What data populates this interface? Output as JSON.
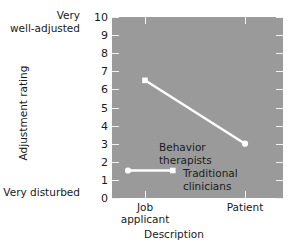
{
  "chart_data": {
    "type": "line",
    "title": "",
    "xlabel": "Description",
    "ylabel": "Adjustment rating",
    "categories": [
      "Job applicant",
      "Patient"
    ],
    "x": [
      0,
      1
    ],
    "ylim": [
      0,
      10
    ],
    "yticks": [
      0,
      1,
      2,
      3,
      4,
      5,
      6,
      7,
      8,
      9,
      10
    ],
    "ytick_labels": [
      "0",
      "1",
      "2",
      "3",
      "4",
      "5",
      "6",
      "7",
      "8",
      "9",
      "10"
    ],
    "y_axis_low_label": "Very disturbed",
    "y_axis_high_label_line1": "Very",
    "y_axis_high_label_line2": "well-adjusted",
    "grid": false,
    "legend_position": "inside-lower-left",
    "series": [
      {
        "name": "Traditional clinicians",
        "values": [
          6.5,
          3.0
        ],
        "color": "#ffffff",
        "marker": "circle-square",
        "linewidth": 2.4
      },
      {
        "name": "Behavior therapists",
        "values": [
          1.5,
          1.5
        ],
        "color": "#ffffff",
        "note": "annotation only; flat legend sample line inside plot"
      }
    ],
    "annotations": [
      {
        "text_line1": "Behavior",
        "text_line2": "therapists",
        "x": 0.28,
        "y": 2.9
      },
      {
        "text_line1": "Traditional",
        "text_line2": "clinicians",
        "x": 0.42,
        "y": 1.6
      }
    ],
    "plot_background": "#9a9a9a",
    "figure_background": "#ffffff",
    "tick_color": "#f2f2f2"
  },
  "axes": {
    "y_title": "Adjustment rating",
    "x_title": "Description",
    "y_high_line1": "Very",
    "y_high_line2": "well-adjusted",
    "y_low": "Very disturbed",
    "yticks": [
      "10",
      "9",
      "8",
      "7",
      "6",
      "5",
      "4",
      "3",
      "2",
      "1",
      "0"
    ],
    "xticks": [
      {
        "line1": "Job",
        "line2": "applicant"
      },
      {
        "line1": "Patient",
        "line2": ""
      }
    ]
  },
  "annotations": {
    "behavior_line1": "Behavior",
    "behavior_line2": "therapists",
    "traditional_line1": "Traditional",
    "traditional_line2": "clinicians"
  }
}
